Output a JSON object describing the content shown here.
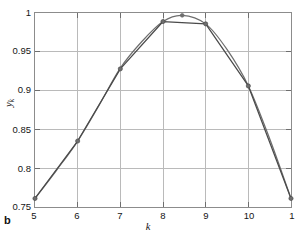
{
  "panel": {
    "letter": "b"
  },
  "axes": {
    "xlabel": "k",
    "ylabel_var": "y",
    "ylabel_sub": "k",
    "xticks": [
      "5",
      "6",
      "7",
      "8",
      "9",
      "10",
      "1"
    ],
    "yticks": [
      "0.75",
      "0.8",
      "0.85",
      "0.9",
      "0.95",
      "1"
    ]
  },
  "style": {
    "line_color": "#4a4a4a",
    "marker_color": "#6e6e6e",
    "grid_color": "#b9b9b9",
    "frame_color": "#8c8c8c",
    "background": "#ffffff"
  },
  "chart_data": {
    "type": "line",
    "title": "",
    "xlabel": "k",
    "ylabel": "y_k",
    "xlim": [
      5,
      11
    ],
    "ylim": [
      0.75,
      1.0
    ],
    "xticks": [
      5,
      6,
      7,
      8,
      9,
      10,
      11
    ],
    "yticks": [
      0.75,
      0.8,
      0.85,
      0.9,
      0.95,
      1.0
    ],
    "grid": true,
    "legend": "none",
    "series": [
      {
        "name": "data",
        "style": "piecewise-linear-with-markers",
        "markers": true,
        "color": "#4a4a4a",
        "x": [
          5,
          6,
          7,
          8,
          9,
          10,
          11
        ],
        "y": [
          0.761,
          0.835,
          0.928,
          0.989,
          0.986,
          0.906,
          0.761
        ]
      },
      {
        "name": "fitted curve",
        "style": "smooth",
        "markers": true,
        "color": "#6e6e6e",
        "x": [
          5,
          5.5,
          6,
          6.5,
          7,
          7.5,
          8,
          8.45,
          9,
          9.5,
          10,
          10.5,
          11
        ],
        "y": [
          0.761,
          0.797,
          0.835,
          0.881,
          0.929,
          0.963,
          0.989,
          0.997,
          0.986,
          0.953,
          0.906,
          0.838,
          0.761
        ]
      }
    ],
    "peak": {
      "x": 8.45,
      "y": 0.997
    }
  }
}
